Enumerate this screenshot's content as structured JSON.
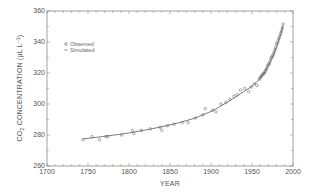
{
  "chart_data": {
    "type": "scatter",
    "title": "",
    "xlabel": "YEAR",
    "ylabel": "CO2 CONCENTRATION (μL L⁻¹)",
    "ylabel_parts": {
      "prefix": "CO",
      "sub": "2",
      "middle": " CONCENTRATION (μL L",
      "sup": "−1",
      "suffix": ")"
    },
    "xlim": [
      1700,
      2000
    ],
    "ylim": [
      260,
      360
    ],
    "xticks": [
      1700,
      1750,
      1800,
      1850,
      1900,
      1950,
      2000
    ],
    "yticks": [
      260,
      280,
      300,
      320,
      340,
      360
    ],
    "x_minor_step": 10,
    "y_minor_step": 10,
    "grid": false,
    "legend_position": "upper-left",
    "legend": [
      {
        "label": "Observed",
        "marker": "open-circle"
      },
      {
        "label": "Simulated",
        "marker": "line"
      }
    ],
    "series": [
      {
        "name": "Observed",
        "style": "open-circle",
        "x": [
          1744,
          1755,
          1764,
          1772,
          1774,
          1791,
          1804,
          1806,
          1815,
          1826,
          1838,
          1840,
          1847,
          1855,
          1865,
          1872,
          1881,
          1890,
          1893,
          1902,
          1906,
          1912,
          1918,
          1923,
          1928,
          1932,
          1936,
          1941,
          1946,
          1949,
          1953,
          1956,
          1959,
          1960,
          1961,
          1962,
          1963,
          1964,
          1965,
          1966,
          1967,
          1968,
          1969,
          1970,
          1971,
          1972,
          1973,
          1974,
          1975,
          1976,
          1977,
          1978,
          1979,
          1980,
          1981,
          1982,
          1983,
          1984,
          1985,
          1986,
          1987,
          1988
        ],
        "y": [
          277,
          279,
          277,
          279,
          279,
          280,
          283,
          281,
          283,
          284,
          285,
          283,
          286,
          287,
          288,
          288,
          291,
          293,
          297,
          296,
          295,
          300,
          301,
          303,
          305,
          306,
          309,
          310,
          308,
          311,
          313,
          312,
          316,
          317,
          317.5,
          318.5,
          319,
          319.5,
          320,
          321,
          322,
          323,
          324.5,
          325.5,
          326,
          327.5,
          329.5,
          330,
          331,
          332,
          333.5,
          335,
          336.5,
          338.5,
          339.5,
          341,
          342.5,
          344,
          345.5,
          347,
          349,
          351.5
        ]
      },
      {
        "name": "Simulated",
        "style": "line",
        "x": [
          1744,
          1760,
          1780,
          1800,
          1820,
          1840,
          1860,
          1880,
          1900,
          1910,
          1920,
          1930,
          1940,
          1950,
          1955,
          1960,
          1965,
          1970,
          1975,
          1980,
          1985,
          1988
        ],
        "y": [
          277.5,
          278.5,
          279.8,
          281.3,
          283.2,
          285.3,
          287.8,
          290.8,
          295.2,
          298.0,
          301.2,
          304.5,
          308.0,
          311.5,
          313.8,
          316.8,
          320.0,
          324.8,
          330.0,
          337.0,
          345.0,
          351.0
        ]
      }
    ]
  },
  "style": {
    "axis_color": "#8a8a8a",
    "marker_color": "#666666",
    "line_color": "#444444"
  }
}
